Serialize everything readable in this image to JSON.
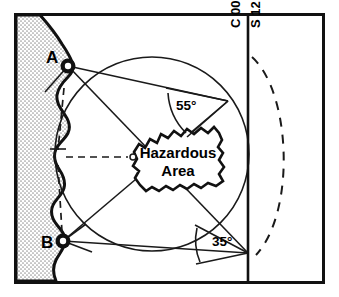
{
  "diagram": {
    "type": "nautical-chart",
    "stations": [
      {
        "id": "A",
        "label": "A",
        "x": 68,
        "y": 66
      },
      {
        "id": "B",
        "label": "B",
        "x": 63,
        "y": 241
      }
    ],
    "angles": [
      {
        "id": "upper",
        "label": "55°",
        "value": 55,
        "unit": "degrees",
        "x": 176,
        "y": 110
      },
      {
        "id": "lower",
        "label": "35°",
        "value": 35,
        "unit": "degrees",
        "x": 212,
        "y": 246
      }
    ],
    "hazard": {
      "line1": "Hazardous",
      "line2": "Area",
      "center_x": 178,
      "center_y": 160
    },
    "course_labels": [
      {
        "id": "course",
        "label": "C 000",
        "x": 240,
        "y": 26
      },
      {
        "id": "speed",
        "label": "S 12",
        "x": 259,
        "y": 26
      }
    ],
    "colors": {
      "ink": "#111111",
      "line": "#1a1a1a",
      "land_fill": "#d8d8d8",
      "water_fill": "#ffffff",
      "background": "#ffffff"
    },
    "geometry": {
      "frame": {
        "x": 14,
        "y": 13,
        "width": 310,
        "height": 270
      },
      "range_circle": {
        "cx": 152,
        "cy": 154,
        "r": 97
      },
      "course_line": {
        "x": 248,
        "y1": 16,
        "y2": 281
      },
      "convergence_point": {
        "x": 248,
        "y": 253
      },
      "vertex_55": {
        "x": 228,
        "y": 101
      },
      "dashed_arc_radius": 105,
      "reference_mark": {
        "x": 133,
        "y": 157
      }
    }
  }
}
